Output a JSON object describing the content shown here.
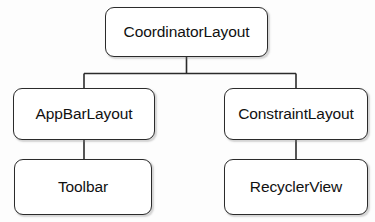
{
  "diagram": {
    "type": "tree-hierarchy",
    "title": "",
    "nodes": [
      {
        "id": "coordinatorlayout",
        "label": "CoordinatorLayout",
        "level": 0
      },
      {
        "id": "appbarlayout",
        "label": "AppBarLayout",
        "level": 1
      },
      {
        "id": "constraintlayout",
        "label": "ConstraintLayout",
        "level": 1
      },
      {
        "id": "toolbar",
        "label": "Toolbar",
        "level": 2
      },
      {
        "id": "recyclerview",
        "label": "RecyclerView",
        "level": 2
      }
    ],
    "edges": [
      {
        "from": "coordinatorlayout",
        "to": "appbarlayout"
      },
      {
        "from": "coordinatorlayout",
        "to": "constraintlayout"
      },
      {
        "from": "appbarlayout",
        "to": "toolbar"
      },
      {
        "from": "constraintlayout",
        "to": "recyclerview"
      }
    ],
    "style": {
      "background_color": "#fdfdfd",
      "node_fill": "#ffffff",
      "node_stroke": "#2b2b2b",
      "edge_stroke": "#2b2b2b",
      "label_color": "#111111"
    }
  }
}
